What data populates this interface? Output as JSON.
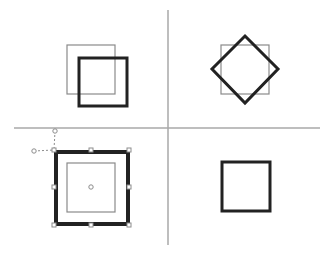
{
  "canvas": {
    "width": 334,
    "height": 254,
    "background": "#ffffff"
  },
  "colors": {
    "divider": "#a8a8a8",
    "thin_stroke": "#8a8a8a",
    "thick_stroke": "#222222",
    "handle_fill": "#ffffff",
    "handle_stroke": "#8c8c8c"
  },
  "dividers": {
    "vertical": {
      "x": 168,
      "y1": 10,
      "y2": 245
    },
    "horizontal": {
      "y": 128,
      "x1": 14,
      "x2": 320
    }
  },
  "quadrants": [
    {
      "name": "translate",
      "original": {
        "x": 67,
        "y": 45,
        "w": 48,
        "h": 49
      },
      "transformed": {
        "type": "rect",
        "x": 79,
        "y": 58,
        "w": 48,
        "h": 48
      }
    },
    {
      "name": "rotate",
      "original": {
        "x": 221,
        "y": 45,
        "w": 48,
        "h": 49
      },
      "transformed": {
        "type": "diamond",
        "points": "245,36 278,69 245,103 212,69"
      }
    },
    {
      "name": "scale-selected",
      "original": {
        "x": 67,
        "y": 163,
        "w": 48,
        "h": 49
      },
      "transformed": {
        "type": "rect",
        "x": 56,
        "y": 152,
        "w": 72,
        "h": 72
      },
      "selection": {
        "handles": [
          [
            54,
            150
          ],
          [
            91,
            150
          ],
          [
            129,
            150
          ],
          [
            54,
            187
          ],
          [
            129,
            187
          ],
          [
            54,
            225
          ],
          [
            91,
            225
          ],
          [
            129,
            225
          ]
        ],
        "center": [
          91,
          187
        ],
        "rotate_handle": [
          55,
          131
        ],
        "skew_handle": [
          34,
          151
        ]
      }
    },
    {
      "name": "result",
      "transformed": {
        "type": "rect",
        "x": 222,
        "y": 162,
        "w": 48,
        "h": 49
      }
    }
  ]
}
